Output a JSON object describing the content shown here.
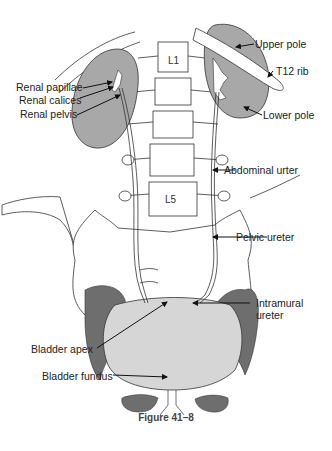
{
  "figure": {
    "caption": "Figure 41–8",
    "vertebra_labels": {
      "top": "L1",
      "bottom": "L5"
    },
    "labels": {
      "renal_papillae": "Renal papillae",
      "renal_calices": "Renal calices",
      "renal_pelvis": "Renal pelvis",
      "upper_pole": "Upper pole",
      "t12_rib": "T12 rib",
      "lower_pole": "Lower pole",
      "abdominal_ureter": "Abdominal urter",
      "pelvic_ureter": "Pelvic ureter",
      "intramural_ureter_line1": "Intramural",
      "intramural_ureter_line2": "ureter",
      "bladder_apex": "Bladder apex",
      "bladder_fundus": "Bladder fundus"
    },
    "colors": {
      "kidney": "#a8a8a8",
      "pelvic_muscle": "#6e6e6e",
      "bladder": "#d6d6d6",
      "outline": "#333333",
      "background": "#ffffff"
    }
  }
}
